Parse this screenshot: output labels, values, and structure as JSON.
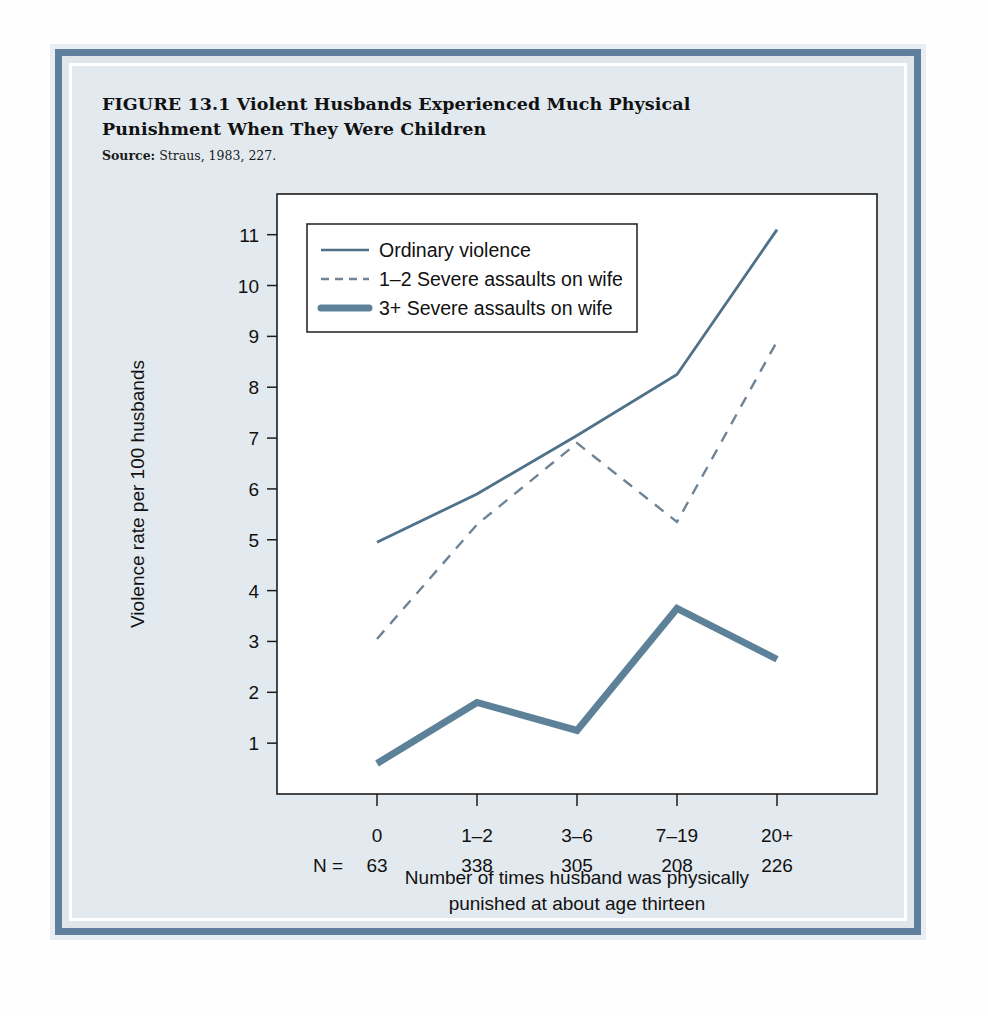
{
  "figure": {
    "title": "FIGURE 13.1  Violent Husbands Experienced Much Physical Punishment When They Were Children",
    "source_label": "Source:",
    "source_text": " Straus, 1983, 227."
  },
  "chart_data": {
    "type": "line",
    "title": "Violent Husbands Experienced Much Physical Punishment When They Were Children",
    "xlabel": "Number of times husband was physically punished at about age thirteen",
    "xlabel_line1": "Number of times husband was physically",
    "xlabel_line2": "punished at about age thirteen",
    "ylabel": "Violence rate per 100 husbands",
    "categories": [
      "0",
      "1–2",
      "3–6",
      "7–19",
      "20+"
    ],
    "n_prefix": "N =",
    "n_values": [
      "63",
      "338",
      "305",
      "208",
      "226"
    ],
    "yticks": [
      1,
      2,
      3,
      4,
      5,
      6,
      7,
      8,
      9,
      10,
      11
    ],
    "ylim": [
      0,
      11.8
    ],
    "grid": false,
    "legend_position": "top-left inside plot",
    "series": [
      {
        "name": "Ordinary violence",
        "style": "solid-thin",
        "color": "#4f7189",
        "values": [
          4.95,
          5.9,
          7.05,
          8.25,
          11.1
        ]
      },
      {
        "name": "1–2 Severe assaults on wife",
        "style": "dashed",
        "color": "#6e8496",
        "values": [
          3.05,
          5.3,
          6.9,
          5.35,
          8.9
        ]
      },
      {
        "name": "3+ Severe assaults on wife",
        "style": "solid-thick",
        "color": "#5d8199",
        "values": [
          0.6,
          1.8,
          1.25,
          3.65,
          2.65
        ]
      }
    ]
  },
  "colors": {
    "frame_blue": "#5f7f9c",
    "panel_bg": "#e3eaef",
    "line_ordinary": "#4f7189",
    "line_dashed": "#6e8496",
    "line_thick": "#5d8199"
  }
}
